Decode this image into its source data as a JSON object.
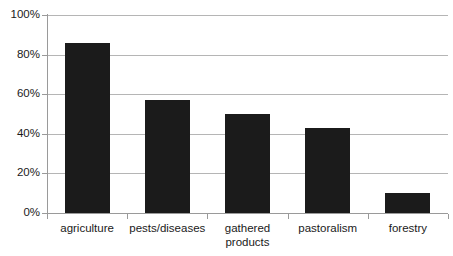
{
  "chart_data": {
    "type": "bar",
    "title": "",
    "subtitle": "",
    "xlabel": "",
    "ylabel": "",
    "categories": [
      "agriculture",
      "pests/diseases",
      "gathered products",
      "pastoralism",
      "forestry"
    ],
    "category_lines": [
      [
        "agriculture"
      ],
      [
        "pests/diseases"
      ],
      [
        "gathered",
        "products"
      ],
      [
        "pastoralism"
      ],
      [
        "forestry"
      ]
    ],
    "values": [
      86,
      57,
      50,
      43,
      10
    ],
    "value_labels": [
      "86%",
      "57%",
      "50%",
      "43%",
      "10%"
    ],
    "ylim": [
      0,
      100
    ],
    "y_ticks": [
      0,
      20,
      40,
      60,
      80,
      100
    ],
    "y_tick_labels": [
      "0%",
      "20%",
      "40%",
      "60%",
      "80%",
      "100%"
    ],
    "grid": true,
    "grid_axis": "y",
    "legend": false,
    "legend_position": "none",
    "bar_color": "#1b1b1b",
    "grid_color": "#b5b5b5",
    "axis_color": "#9a9a9a",
    "background_color": "#ffffff",
    "text_color": "#1a1a1a"
  }
}
